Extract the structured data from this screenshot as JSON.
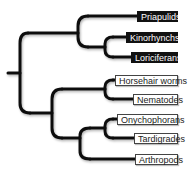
{
  "diagram": {
    "type": "phylogenetic-tree",
    "colors": {
      "line": "#111111",
      "dark_label_bg": "#111111",
      "dark_label_text": "#ffffff",
      "light_label_bg": "#ffffff",
      "light_label_text": "#222222"
    },
    "taxa": [
      {
        "name": "Priapulids",
        "style": "dark"
      },
      {
        "name": "Kinorhynchs",
        "style": "dark"
      },
      {
        "name": "Loriciferans",
        "style": "dark"
      },
      {
        "name": "Horsehair worms",
        "style": "light"
      },
      {
        "name": "Nematodes",
        "style": "light"
      },
      {
        "name": "Onychophorans",
        "style": "light"
      },
      {
        "name": "Tardigrades",
        "style": "light"
      },
      {
        "name": "Arthropods",
        "style": "light"
      }
    ],
    "clades": {
      "upper": [
        "Priapulids",
        [
          "Kinorhynchs",
          "Loriciferans"
        ]
      ],
      "lower": [
        [
          "Horsehair worms",
          "Nematodes"
        ],
        [
          [
            "Onychophorans",
            "Tardigrades"
          ],
          "Arthropods"
        ]
      ]
    }
  }
}
